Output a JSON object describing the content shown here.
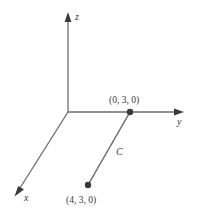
{
  "figure": {
    "background_color": "#ffffff",
    "stroke_color": "#6b6b6b",
    "text_color": "#3a3a3a",
    "axes": [
      {
        "name": "x",
        "label": "x",
        "direction": "down-left"
      },
      {
        "name": "y",
        "label": "y",
        "direction": "right"
      },
      {
        "name": "z",
        "label": "z",
        "direction": "up"
      }
    ],
    "points": [
      {
        "name": "point-upper",
        "label": "(0, 3, 0)",
        "cx": 130,
        "cy": 112,
        "r": 3.2
      },
      {
        "name": "point-lower",
        "label": "(4, 3, 0)",
        "cx": 88,
        "cy": 185,
        "r": 3.2
      }
    ],
    "segment": {
      "name": "C",
      "label": "C",
      "from": "(0, 3, 0)",
      "to": "(4, 3, 0)"
    }
  }
}
